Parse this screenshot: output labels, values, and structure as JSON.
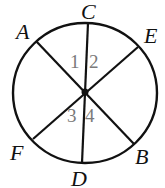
{
  "diagram": {
    "type": "circle-with-diameters",
    "colors": {
      "stroke": "#111111",
      "angle_labels": "#7a7a7a",
      "background": "#ffffff"
    },
    "circle": {
      "cx": 85,
      "cy": 93,
      "rx": 72,
      "ry": 70
    },
    "center_point": {
      "x": 85,
      "y": 92,
      "r": 3.5
    },
    "points": [
      {
        "name": "A",
        "label": "A",
        "x": 36,
        "y": 41,
        "lx": 16,
        "ly": 39
      },
      {
        "name": "C",
        "label": "C",
        "x": 88,
        "y": 23,
        "lx": 81,
        "ly": 19
      },
      {
        "name": "E",
        "label": "E",
        "x": 138,
        "y": 47,
        "lx": 144,
        "ly": 43
      },
      {
        "name": "F",
        "label": "F",
        "x": 33,
        "y": 139,
        "lx": 10,
        "ly": 160
      },
      {
        "name": "D",
        "label": "D",
        "x": 82,
        "y": 163,
        "lx": 71,
        "ly": 186
      },
      {
        "name": "B",
        "label": "B",
        "x": 134,
        "y": 144,
        "lx": 135,
        "ly": 164
      }
    ],
    "segments": [
      {
        "name": "segment-CD",
        "from": "C",
        "to": "D"
      },
      {
        "name": "segment-AB",
        "from": "A",
        "to": "B"
      },
      {
        "name": "segment-EF",
        "from": "E",
        "to": "F"
      }
    ],
    "angle_labels": [
      {
        "label": "1",
        "x": 70,
        "y": 68
      },
      {
        "label": "2",
        "x": 89,
        "y": 68
      },
      {
        "label": "3",
        "x": 67,
        "y": 122
      },
      {
        "label": "4",
        "x": 85,
        "y": 122
      }
    ]
  }
}
